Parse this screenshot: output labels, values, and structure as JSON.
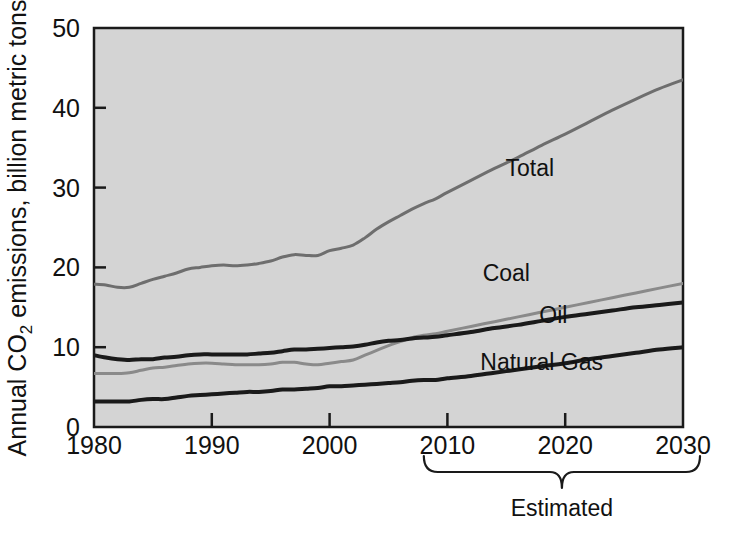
{
  "chart_data": {
    "type": "line",
    "title": "",
    "xlabel": "",
    "ylabel": "Annual CO2 emissions, billion metric tons",
    "ylabel_parts": {
      "before": "Annual CO",
      "subscript": "2",
      "after": " emissions, billion metric tons"
    },
    "xlim": [
      1980,
      2030
    ],
    "ylim": [
      0,
      50
    ],
    "xticks": [
      "1980",
      "1990",
      "2000",
      "2010",
      "2020",
      "2030"
    ],
    "xtick_values": [
      1980,
      1990,
      2000,
      2010,
      2020,
      2030
    ],
    "yticks": [
      "0",
      "10",
      "20",
      "30",
      "40",
      "50"
    ],
    "ytick_values": [
      0,
      10,
      20,
      30,
      40,
      50
    ],
    "grid": false,
    "legend_position": "inline-annotations",
    "plot_background": "#d4d4d4",
    "annotations": [
      {
        "text": "Estimated",
        "x_start": 2008,
        "x_end": 2030,
        "kind": "brace-below-axis"
      }
    ],
    "x": [
      1980,
      1981,
      1982,
      1983,
      1984,
      1985,
      1986,
      1987,
      1988,
      1989,
      1990,
      1991,
      1992,
      1993,
      1994,
      1995,
      1996,
      1997,
      1998,
      1999,
      2000,
      2001,
      2002,
      2003,
      2004,
      2005,
      2006,
      2007,
      2008,
      2009,
      2010,
      2012,
      2014,
      2016,
      2018,
      2020,
      2022,
      2024,
      2026,
      2028,
      2030
    ],
    "series": [
      {
        "name": "Total",
        "label": "Total",
        "color": "#6e6e6e",
        "width": 3,
        "label_x": 2017,
        "label_y": 31.5,
        "values": [
          17.9,
          17.8,
          17.5,
          17.5,
          18.0,
          18.5,
          18.9,
          19.3,
          19.8,
          20.0,
          20.2,
          20.3,
          20.2,
          20.3,
          20.5,
          20.8,
          21.3,
          21.6,
          21.5,
          21.5,
          22.1,
          22.4,
          22.8,
          23.7,
          24.8,
          25.7,
          26.5,
          27.3,
          28.0,
          28.6,
          29.4,
          30.9,
          32.4,
          33.8,
          35.3,
          36.7,
          38.2,
          39.7,
          41.1,
          42.4,
          43.5
        ]
      },
      {
        "name": "Coal",
        "label": "Coal",
        "color": "#8a8a8a",
        "width": 3,
        "label_x": 2015,
        "label_y": 18.3,
        "values": [
          6.7,
          6.7,
          6.7,
          6.8,
          7.1,
          7.4,
          7.5,
          7.7,
          7.9,
          8.0,
          8.0,
          7.9,
          7.8,
          7.8,
          7.8,
          7.9,
          8.1,
          8.1,
          7.9,
          7.8,
          8.0,
          8.2,
          8.4,
          9.0,
          9.6,
          10.2,
          10.7,
          11.2,
          11.5,
          11.7,
          12.0,
          12.6,
          13.2,
          13.8,
          14.4,
          15.0,
          15.6,
          16.2,
          16.8,
          17.4,
          18.0
        ]
      },
      {
        "name": "Oil",
        "label": "Oil",
        "color": "#1a1a1a",
        "width": 4,
        "label_x": 2019,
        "label_y": 13.0,
        "values": [
          9.0,
          8.7,
          8.5,
          8.4,
          8.5,
          8.5,
          8.7,
          8.8,
          9.0,
          9.1,
          9.1,
          9.1,
          9.1,
          9.1,
          9.2,
          9.3,
          9.5,
          9.7,
          9.7,
          9.8,
          9.9,
          10.0,
          10.1,
          10.3,
          10.6,
          10.8,
          10.9,
          11.1,
          11.2,
          11.3,
          11.5,
          11.9,
          12.4,
          12.8,
          13.3,
          13.8,
          14.2,
          14.6,
          15.0,
          15.3,
          15.6
        ]
      },
      {
        "name": "Natural Gas",
        "label": "Natural Gas",
        "color": "#1a1a1a",
        "width": 4,
        "label_x": 2018,
        "label_y": 7.2,
        "values": [
          3.2,
          3.2,
          3.2,
          3.2,
          3.4,
          3.5,
          3.5,
          3.7,
          3.9,
          4.0,
          4.1,
          4.2,
          4.3,
          4.4,
          4.4,
          4.5,
          4.7,
          4.7,
          4.8,
          4.9,
          5.1,
          5.1,
          5.2,
          5.3,
          5.4,
          5.5,
          5.6,
          5.8,
          5.9,
          5.9,
          6.1,
          6.4,
          6.8,
          7.2,
          7.6,
          8.0,
          8.5,
          8.9,
          9.3,
          9.7,
          10.0
        ]
      }
    ]
  }
}
